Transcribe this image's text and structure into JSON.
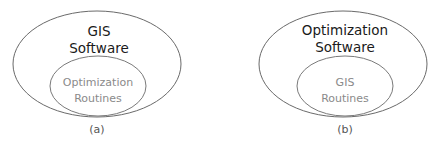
{
  "diagrams": [
    {
      "outer_label_line1": "GIS",
      "outer_label_line2": "Software",
      "inner_label_line1": "Optimization",
      "inner_label_line2": "Routines",
      "caption": "(a)"
    },
    {
      "outer_label_line1": "Optimization",
      "outer_label_line2": "Software",
      "inner_label_line1": "GIS",
      "inner_label_line2": "Routines",
      "caption": "(b)"
    }
  ],
  "colors": {
    "outer_stroke": "#6a6a6a",
    "inner_stroke": "#7a7a7a",
    "outer_text": "#1a1a1a",
    "inner_text": "#8a8a8a"
  }
}
